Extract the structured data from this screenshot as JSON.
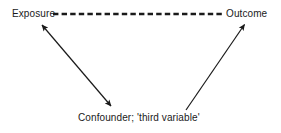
{
  "figure": {
    "background_color": "#ffffff",
    "line_color": "#1a1a1a",
    "text_color": "#1a1a1a"
  },
  "nodes": [
    {
      "id": "exposure",
      "label": "Exposure",
      "position": "top-left"
    },
    {
      "id": "outcome",
      "label": "Outcome",
      "position": "top-right"
    },
    {
      "id": "confounder",
      "label": "Confounder; 'third variable'",
      "position": "bottom-center"
    }
  ],
  "edges": [
    {
      "id": "exposure-outcome",
      "from": "exposure",
      "to": "outcome",
      "style": "dashed",
      "arrowheads": "none",
      "x1": 53,
      "y1": 14,
      "x2": 222,
      "y2": 14
    },
    {
      "id": "exposure-confounder",
      "from": "exposure",
      "to": "confounder",
      "style": "solid",
      "arrowheads": "both",
      "x1": 40,
      "y1": 22,
      "x2": 113,
      "y2": 108
    },
    {
      "id": "confounder-outcome",
      "from": "confounder",
      "to": "outcome",
      "style": "solid",
      "arrowheads": "end",
      "x1": 186,
      "y1": 110,
      "x2": 246,
      "y2": 22
    }
  ]
}
